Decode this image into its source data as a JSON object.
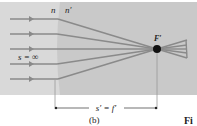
{
  "figure": {
    "panel_label": "(b)",
    "caption_fragment": "Fi",
    "medium_labels": {
      "n": "n",
      "n_prime": "n′"
    },
    "object_distance_label": "s = ∞",
    "focal_point_label": "F′",
    "dimension_label": "s′ = f′",
    "colors": {
      "background": "#ffffff",
      "panel_left": "#d9d9d9",
      "panel_right": "#c9c9c9",
      "ray": "#8a8a8a",
      "focal_point": "#111111",
      "text": "#222222"
    },
    "incoming_ray_count": 5
  }
}
